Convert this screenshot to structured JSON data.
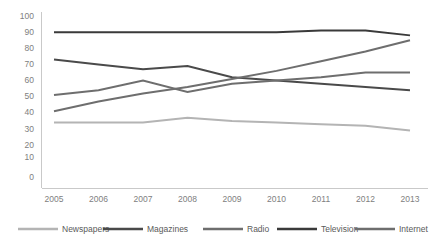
{
  "chart_data": {
    "type": "line",
    "title": "",
    "subtitle": "",
    "xlabel": "",
    "ylabel": "",
    "categories": [
      "2005",
      "2006",
      "2007",
      "2008",
      "2009",
      "2010",
      "2011",
      "2012",
      "2013"
    ],
    "x": [
      2005,
      2006,
      2007,
      2008,
      2009,
      2010,
      2011,
      2012,
      2013
    ],
    "ylim": [
      0,
      100
    ],
    "xlim": [
      2005,
      2013
    ],
    "grid": false,
    "legend_position": "bottom",
    "y_ticks": [
      0,
      10,
      20,
      30,
      40,
      50,
      60,
      70,
      80,
      90,
      100
    ],
    "y_tick_labels": [
      "0",
      "10",
      "20",
      "30",
      "40",
      "50",
      "60",
      "70",
      "80",
      "90",
      "100"
    ],
    "series": [
      {
        "name": "Newspapers",
        "color": "#b4b4b4",
        "width": 2.0,
        "values": [
          34,
          34,
          34,
          37,
          35,
          34,
          33,
          32,
          29
        ]
      },
      {
        "name": "Magazines",
        "color": "#4a4a4a",
        "width": 2.0,
        "values": [
          73,
          70,
          67,
          69,
          62,
          60,
          58,
          56,
          54
        ]
      },
      {
        "name": "Radio",
        "color": "#6e6e6e",
        "width": 2.0,
        "values": [
          51,
          54,
          60,
          53,
          58,
          60,
          62,
          65,
          65
        ]
      },
      {
        "name": "Television",
        "color": "#3a3a3a",
        "width": 2.0,
        "values": [
          90,
          90,
          90,
          90,
          90,
          90,
          91,
          91,
          88
        ]
      },
      {
        "name": "Internet",
        "color": "#6e6e6e",
        "width": 2.0,
        "values": [
          41,
          47,
          52,
          56,
          61,
          66,
          72,
          78,
          85
        ]
      }
    ]
  },
  "axis": {
    "y_label_color": "#808080",
    "x_label_color": "#808080",
    "axis_color": "#c9c9c9"
  },
  "legend": {
    "items": [
      {
        "label": "Newspapers",
        "color": "#b4b4b4"
      },
      {
        "label": "Magazines",
        "color": "#4a4a4a"
      },
      {
        "label": "Radio",
        "color": "#6e6e6e"
      },
      {
        "label": "Television",
        "color": "#3a3a3a"
      },
      {
        "label": "Internet",
        "color": "#6e6e6e"
      }
    ]
  }
}
